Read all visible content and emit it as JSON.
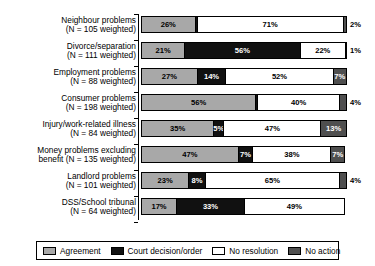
{
  "chart_data": {
    "type": "bar",
    "orientation": "horizontal",
    "stacked": true,
    "stack_mode": "percent",
    "title": "",
    "xlabel": "",
    "ylabel": "",
    "xlim": [
      0,
      100
    ],
    "grid": false,
    "legend_position": "bottom",
    "categories": [
      "Neighbour problems (N = 105 weighted)",
      "Divorce/separation (N = 111 weighted)",
      "Employment problems (N = 88 weighted)",
      "Consumer problems (N = 198 weighted)",
      "Injury/work-related illness (N = 84 weighted)",
      "Money problems excluding benefit (N = 135 weighted)",
      "Landlord problems (N = 101 weighted)",
      "DSS/School tribunal (N = 64 weighted)"
    ],
    "series": [
      {
        "name": "Agreement",
        "color": "#a8a8a8",
        "values": [
          26,
          21,
          27,
          56,
          35,
          47,
          23,
          17
        ]
      },
      {
        "name": "Court decision/order",
        "color": "#111111",
        "values": [
          1,
          56,
          14,
          1,
          5,
          7,
          8,
          33
        ]
      },
      {
        "name": "No resolution",
        "color": "#ffffff",
        "values": [
          71,
          22,
          52,
          40,
          47,
          38,
          65,
          49
        ]
      },
      {
        "name": "No action",
        "color": "#4f4f4f",
        "values": [
          2,
          1,
          7,
          4,
          13,
          7,
          4,
          0
        ]
      }
    ]
  },
  "axis": {
    "name": "category-axis"
  },
  "rows": [
    {
      "line1": "Neighbour problems",
      "line2": "(N = 105 weighted)",
      "segments": [
        {
          "series": "Agreement",
          "label": "26%",
          "value": 26,
          "outside": false
        },
        {
          "series": "Court decision/order",
          "label": "1%",
          "value": 1,
          "outside": true
        },
        {
          "series": "No resolution",
          "label": "71%",
          "value": 71,
          "outside": false
        },
        {
          "series": "No action",
          "label": "2%",
          "value": 2,
          "outside": true
        }
      ]
    },
    {
      "line1": "Divorce/separation",
      "line2": "(N = 111 weighted)",
      "segments": [
        {
          "series": "Agreement",
          "label": "21%",
          "value": 21,
          "outside": false
        },
        {
          "series": "Court decision/order",
          "label": "56%",
          "value": 56,
          "outside": false
        },
        {
          "series": "No resolution",
          "label": "22%",
          "value": 22,
          "outside": false
        },
        {
          "series": "No action",
          "label": "1%",
          "value": 1,
          "outside": true
        }
      ]
    },
    {
      "line1": "Employment problems",
      "line2": "(N = 88 weighted)",
      "segments": [
        {
          "series": "Agreement",
          "label": "27%",
          "value": 27,
          "outside": false
        },
        {
          "series": "Court decision/order",
          "label": "14%",
          "value": 14,
          "outside": false
        },
        {
          "series": "No resolution",
          "label": "52%",
          "value": 52,
          "outside": false
        },
        {
          "series": "No action",
          "label": "7%",
          "value": 7,
          "outside": false
        }
      ]
    },
    {
      "line1": "Consumer problems",
      "line2": "(N = 198 weighted)",
      "segments": [
        {
          "series": "Agreement",
          "label": "56%",
          "value": 56,
          "outside": false
        },
        {
          "series": "Court decision/order",
          "label": "1%",
          "value": 1,
          "outside": true
        },
        {
          "series": "No resolution",
          "label": "40%",
          "value": 40,
          "outside": false
        },
        {
          "series": "No action",
          "label": "4%",
          "value": 4,
          "outside": true
        }
      ]
    },
    {
      "line1": "Injury/work-related illness",
      "line2": "(N = 84 weighted)",
      "segments": [
        {
          "series": "Agreement",
          "label": "35%",
          "value": 35,
          "outside": false
        },
        {
          "series": "Court decision/order",
          "label": "5%",
          "value": 5,
          "outside": false
        },
        {
          "series": "No resolution",
          "label": "47%",
          "value": 47,
          "outside": false
        },
        {
          "series": "No action",
          "label": "13%",
          "value": 13,
          "outside": false
        }
      ]
    },
    {
      "line1": "Money problems excluding",
      "line2": "benefit (N = 135 weighted)",
      "segments": [
        {
          "series": "Agreement",
          "label": "47%",
          "value": 47,
          "outside": false
        },
        {
          "series": "Court decision/order",
          "label": "7%",
          "value": 7,
          "outside": false
        },
        {
          "series": "No resolution",
          "label": "38%",
          "value": 38,
          "outside": false
        },
        {
          "series": "No action",
          "label": "7%",
          "value": 7,
          "outside": false
        }
      ]
    },
    {
      "line1": "Landlord problems",
      "line2": "(N = 101 weighted)",
      "segments": [
        {
          "series": "Agreement",
          "label": "23%",
          "value": 23,
          "outside": false
        },
        {
          "series": "Court decision/order",
          "label": "8%",
          "value": 8,
          "outside": false
        },
        {
          "series": "No resolution",
          "label": "65%",
          "value": 65,
          "outside": false
        },
        {
          "series": "No action",
          "label": "4%",
          "value": 4,
          "outside": true
        }
      ]
    },
    {
      "line1": "DSS/School tribunal",
      "line2": "(N = 64 weighted)",
      "segments": [
        {
          "series": "Agreement",
          "label": "17%",
          "value": 17,
          "outside": false
        },
        {
          "series": "Court decision/order",
          "label": "33%",
          "value": 33,
          "outside": false
        },
        {
          "series": "No resolution",
          "label": "49%",
          "value": 49,
          "outside": false
        }
      ]
    }
  ],
  "legend": {
    "items": [
      {
        "label": "Agreement",
        "key": "agreement"
      },
      {
        "label": "Court decision/order",
        "key": "court"
      },
      {
        "label": "No resolution",
        "key": "none"
      },
      {
        "label": "No action",
        "key": "noaction"
      }
    ]
  }
}
